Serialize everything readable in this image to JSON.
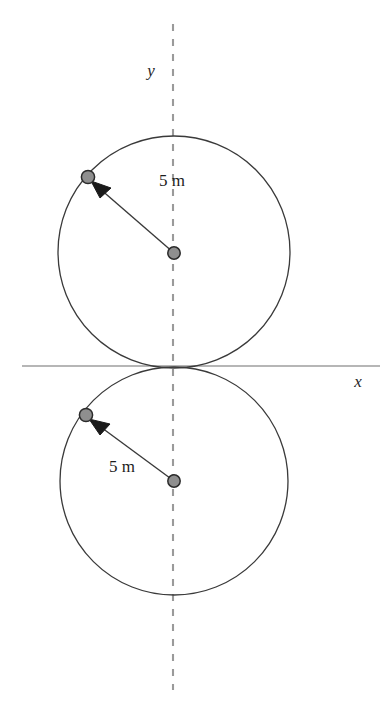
{
  "figure": {
    "title_text": "",
    "background_color": "#ffffff",
    "width": 392,
    "height": 718,
    "axes": {
      "x_axis": {
        "label": "x",
        "label_x": 358,
        "label_y": 387,
        "line_y": 366,
        "line_x1": 22,
        "line_x2": 380,
        "color": "#6e6e6e",
        "style": "solid"
      },
      "y_axis": {
        "label": "y",
        "label_x": 151,
        "label_y": 76,
        "line_x": 173,
        "line_y1": 24,
        "line_y2": 690,
        "color": "#8c8c8c",
        "style": "dashed"
      }
    },
    "circles": [
      {
        "name": "upper-circle",
        "center_x": 174,
        "center_y": 252,
        "radius": 116,
        "stroke": "#3a3a3a",
        "stroke_width": 1.3,
        "fill": "none"
      },
      {
        "name": "lower-circle",
        "center_x": 174,
        "center_y": 481,
        "radius": 114,
        "stroke": "#3a3a3a",
        "stroke_width": 1.3,
        "fill": "none"
      }
    ],
    "center_markers": [
      {
        "name": "upper-center-dot",
        "cx": 174,
        "cy": 253,
        "r": 6.2,
        "fill": "#8f8f8f",
        "stroke": "#2b2b2b"
      },
      {
        "name": "lower-center-dot",
        "cx": 174,
        "cy": 481,
        "r": 6.2,
        "fill": "#8f8f8f",
        "stroke": "#2b2b2b"
      }
    ],
    "particle_markers": [
      {
        "name": "upper-particle-dot",
        "cx": 88,
        "cy": 177,
        "r": 6.6,
        "fill": "#8f8f8f",
        "stroke": "#2b2b2b"
      },
      {
        "name": "lower-particle-dot",
        "cx": 86,
        "cy": 415,
        "r": 6.6,
        "fill": "#8f8f8f",
        "stroke": "#2b2b2b"
      }
    ],
    "radius_arrows": [
      {
        "name": "upper-radius-arrow",
        "x1": 174,
        "y1": 253,
        "x2": 92,
        "y2": 182,
        "color": "#3a3a3a",
        "stroke_width": 1.4
      },
      {
        "name": "lower-radius-arrow",
        "x1": 174,
        "y1": 481,
        "x2": 91,
        "y2": 420,
        "color": "#3a3a3a",
        "stroke_width": 1.4
      }
    ],
    "dimension_labels": [
      {
        "name": "upper-radius-label",
        "text": "5 m",
        "x": 172,
        "y": 186,
        "anchor": "middle"
      },
      {
        "name": "lower-radius-label",
        "text": "5 m",
        "x": 122,
        "y": 472,
        "anchor": "middle"
      }
    ]
  }
}
